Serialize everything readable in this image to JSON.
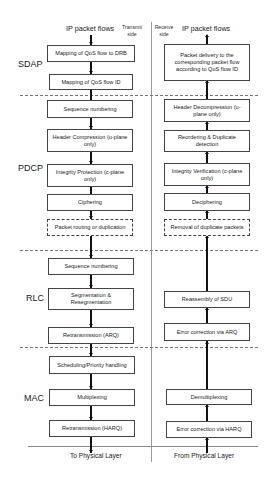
{
  "header": {
    "transmit_flow_label": "IP packet flows",
    "receive_flow_label": "IP packet flows",
    "transmit_side_label": "Transmit side",
    "receive_side_label": "Receive side"
  },
  "layers": {
    "sdap": {
      "label": "SDAP",
      "transmit": [
        "Mapping of QoS flow to DRB",
        "Mapping of QoS flow ID"
      ],
      "receive": [
        "Packet delivery to the corresponding packet flow according to QoS flow ID"
      ]
    },
    "pdcp": {
      "label": "PDCP",
      "transmit": [
        "Sequence numbering",
        "Header Compression (u-plane only)",
        "Integrity Protection (c-plane only)",
        "Ciphering",
        "Packet routing or duplication"
      ],
      "receive": [
        "Header Decompression (u-plane only)",
        "Reordering & Duplicate detection",
        "Integrity Verification (c-plane only)",
        "Deciphering",
        "Removal of duplicate packets"
      ]
    },
    "rlc": {
      "label": "RLC",
      "transmit": [
        "Sequence numbering",
        "Segmentation & Resegmentation",
        "Retransmission (ARQ)"
      ],
      "receive": [
        "Reassembly of SDU",
        "Error correction via ARQ"
      ]
    },
    "mac": {
      "label": "MAC",
      "transmit": [
        "Scheduling/Priority handling",
        "Multiplexing",
        "Retransmission (HARQ)"
      ],
      "receive": [
        "Demultiplexing",
        "Error correction via HARQ"
      ]
    }
  },
  "footer": {
    "transmit_label": "To Physical  Layer",
    "receive_label": "From Physical Layer"
  }
}
